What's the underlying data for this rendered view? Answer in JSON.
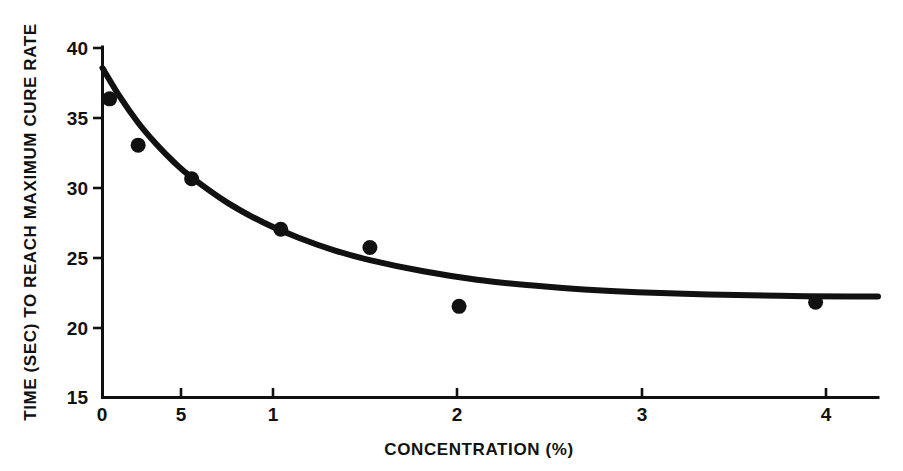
{
  "chart_data": {
    "type": "scatter",
    "title": "",
    "xlabel": "CONCENTRATION (%)",
    "ylabel": "TIME (SEC) TO REACH MAXIMUM CURE RATE",
    "xlim": [
      0,
      4.35
    ],
    "ylim": [
      15,
      40
    ],
    "xticks": [
      0,
      0.5,
      1,
      2,
      3,
      4
    ],
    "xtick_labels": [
      "0",
      "5",
      "1",
      "2",
      "3",
      "4"
    ],
    "yticks": [
      15,
      20,
      25,
      30,
      35,
      40
    ],
    "ytick_labels": [
      "15",
      "20",
      "25",
      "30",
      "35",
      "40"
    ],
    "grid": false,
    "legend": false,
    "series": [
      {
        "name": "Measured points",
        "marker": "filled-circle",
        "color": "#111111",
        "x": [
          0.04,
          0.2,
          0.5,
          1.0,
          1.5,
          2.0,
          4.0
        ],
        "y": [
          36.3,
          33.0,
          30.6,
          27.0,
          25.7,
          21.5,
          21.8
        ]
      },
      {
        "name": "Fitted curve",
        "type": "line",
        "color": "#111111",
        "x": [
          0.0,
          0.1,
          0.2,
          0.3,
          0.4,
          0.5,
          0.7,
          0.9,
          1.1,
          1.3,
          1.5,
          1.8,
          2.1,
          2.4,
          2.7,
          3.0,
          3.4,
          3.8,
          4.2,
          4.35
        ],
        "y": [
          38.5,
          36.4,
          34.6,
          33.1,
          31.8,
          30.7,
          28.9,
          27.5,
          26.4,
          25.5,
          24.8,
          24.0,
          23.4,
          23.0,
          22.7,
          22.5,
          22.35,
          22.25,
          22.2,
          22.2
        ]
      }
    ]
  },
  "axes": {
    "x_title": "CONCENTRATION (%)",
    "y_title": "TIME (SEC) TO REACH MAXIMUM CURE RATE",
    "x_tick_labels": [
      "0",
      "5",
      "1",
      "2",
      "3",
      "4"
    ],
    "y_tick_labels": [
      "15",
      "20",
      "25",
      "30",
      "35",
      "40"
    ]
  }
}
